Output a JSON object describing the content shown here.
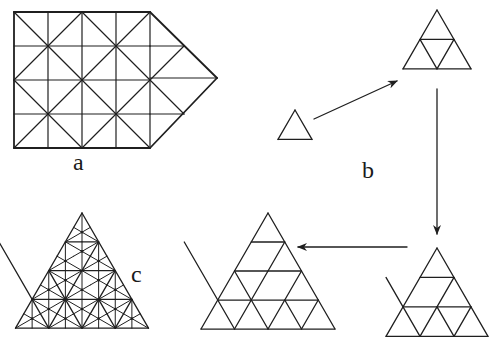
{
  "labels": {
    "a": {
      "text": "a",
      "x": 73,
      "y": 150
    },
    "b": {
      "text": "b",
      "x": 362,
      "y": 158
    },
    "c": {
      "text": "c",
      "x": 131,
      "y": 262
    }
  },
  "colors": {
    "stroke": "#1f1f1f",
    "background": "#ffffff"
  },
  "figure_a": {
    "description": "Pentagon: 4x4 square grid with diagonals plus triangular point",
    "x0": 14,
    "y0": 12,
    "cell": 34,
    "cols": 4,
    "rows": 4,
    "tip": [
      217,
      78
    ]
  },
  "figure_b": {
    "triangles": [
      {
        "name": "order-1",
        "apex": [
          295,
          110
        ],
        "side": 34,
        "order": 1
      },
      {
        "name": "order-2",
        "apex": [
          437,
          10
        ],
        "side": 68,
        "order": 2
      },
      {
        "name": "order-3",
        "apex": [
          437,
          248
        ],
        "side": 102,
        "order": 3
      },
      {
        "name": "order-4",
        "apex": [
          268,
          213
        ],
        "side": 134,
        "order": 4
      }
    ],
    "arrows": [
      {
        "name": "arrow-order1-to-order2",
        "from": [
          314,
          119
        ],
        "to": [
          397,
          81
        ]
      },
      {
        "name": "arrow-order2-to-order3",
        "from": [
          437,
          89
        ],
        "to": [
          437,
          234
        ]
      },
      {
        "name": "arrow-order3-to-order4",
        "from": [
          407,
          247
        ],
        "to": [
          298,
          247
        ]
      }
    ]
  },
  "figure_c": {
    "description": "Order-4 triangle with barycentric subdivision of each small triangle",
    "apex": [
      82,
      213
    ],
    "side": 133,
    "order": 4
  }
}
